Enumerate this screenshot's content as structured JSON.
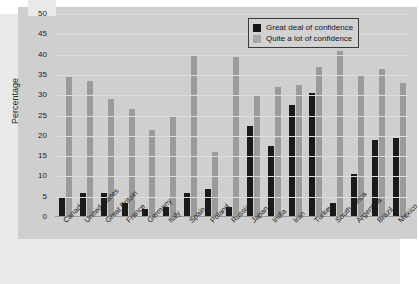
{
  "chart_data": {
    "type": "bar",
    "title": "",
    "xlabel": "",
    "ylabel": "Percentage",
    "ylim": [
      0,
      50
    ],
    "yticks": [
      0,
      5,
      10,
      15,
      20,
      25,
      30,
      35,
      40,
      45,
      50
    ],
    "grid": true,
    "legend_position": "top-right",
    "categories": [
      "Canada",
      "United States",
      "Great Britain",
      "France",
      "Germany",
      "Italy",
      "Spain",
      "Poland",
      "Russia",
      "Japan",
      "India",
      "Iran",
      "Turkey",
      "South Africa",
      "Argentina",
      "Brazil",
      "Mexico"
    ],
    "series": [
      {
        "name": "Great deal of confidence",
        "color": "#1a1a1a",
        "values": [
          5,
          6,
          6,
          3.5,
          2,
          2.5,
          6,
          7,
          2.5,
          22.5,
          17.5,
          27.5,
          30.5,
          3.5,
          10.5,
          19,
          19.5
        ]
      },
      {
        "name": "Quite a lot of confidence",
        "color": "#9b9b9b",
        "values": [
          34.5,
          33.5,
          29,
          26.5,
          21.5,
          25,
          40,
          16,
          39.5,
          30,
          32,
          32.5,
          37,
          41,
          35,
          36.5,
          33
        ]
      }
    ]
  }
}
